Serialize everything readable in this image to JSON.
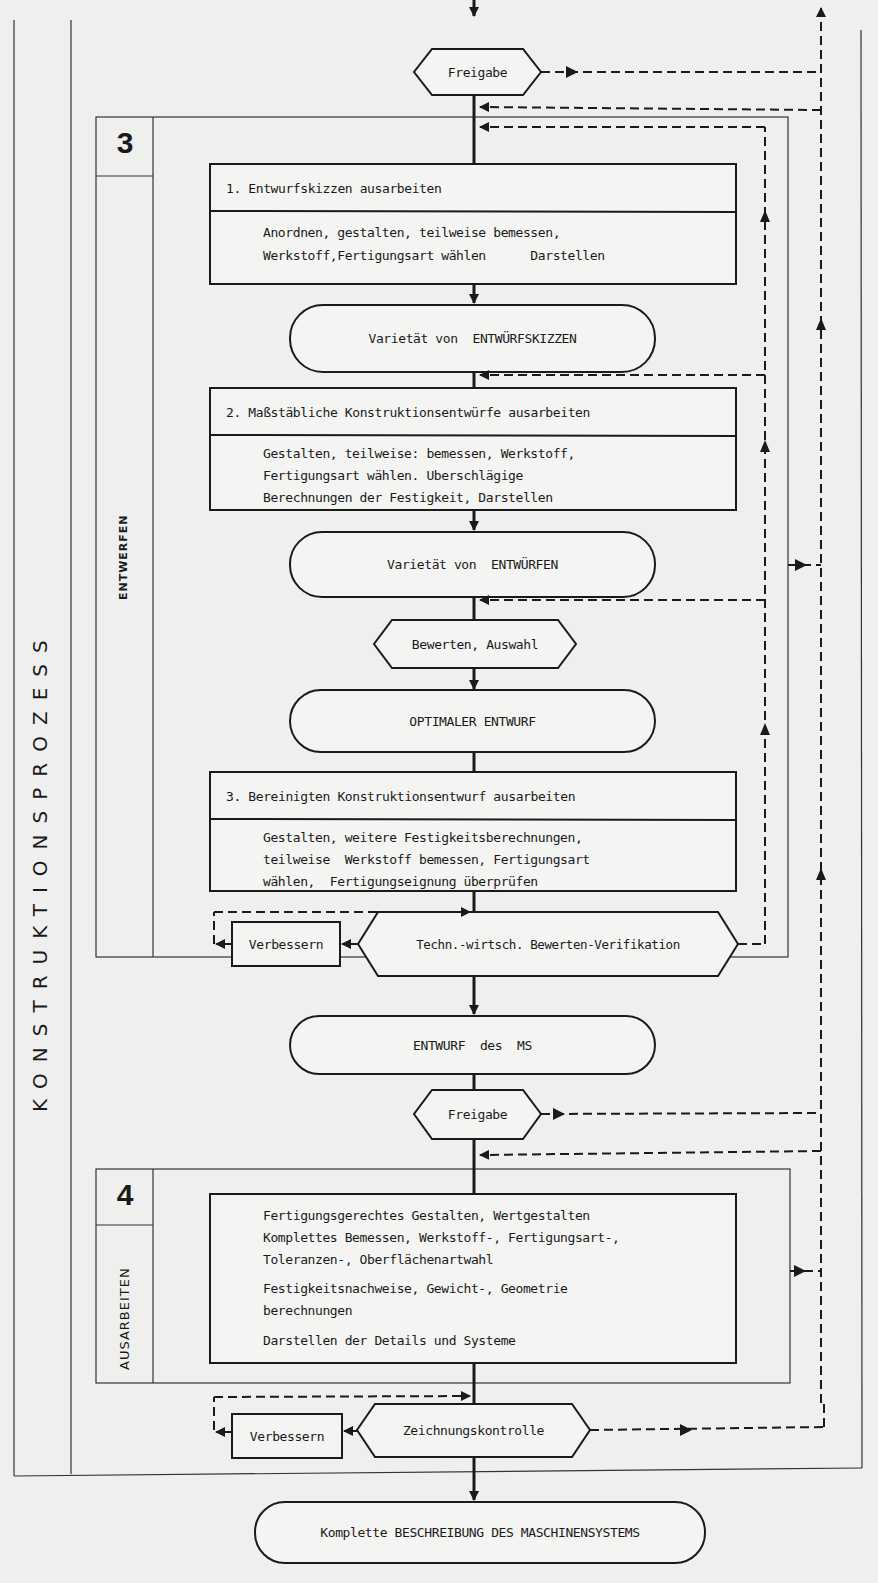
{
  "diagram": {
    "title": "KONSTRUKTIONSPROZESS",
    "phases": [
      {
        "number": "3",
        "name": "ENTWERFEN",
        "steps": [
          {
            "id": "1",
            "heading": "1.  Entwurfskizzen ausarbeiten",
            "lines": [
              "Anordnen, gestalten, teilweise bemessen,",
              "Werkstoff,Fertigungsart wählen      Darstellen"
            ]
          },
          {
            "type": "result",
            "label": "Varietät von  ENTWÜRFSKIZZEN"
          },
          {
            "id": "2",
            "heading": "2.  Maßstäbliche Konstruktionsentwürfe ausarbeiten",
            "lines": [
              "Gestalten, teilweise: bemessen, Werkstoff,",
              "Fertigungsart wählen. Uberschlägige",
              "Berechnungen der Festigkeit, Darstellen"
            ]
          },
          {
            "type": "result",
            "label": "Varietät von  ENTWÜRFEN"
          },
          {
            "type": "decision",
            "label": "Bewerten, Auswahl"
          },
          {
            "type": "result",
            "label": "OPTIMALER ENTWURF"
          },
          {
            "id": "3",
            "heading": "3.  Bereinigten Konstruktionsentwurf ausarbeiten",
            "lines": [
              "Gestalten, weitere Festigkeitsberechnungen,",
              "teilweise  Werkstoff bemessen, Fertigungsart",
              "wählen,  Fertigungseignung überprüfen"
            ]
          },
          {
            "type": "decision",
            "label": "Techn.-wirtsch. Bewerten-Verifikation"
          },
          {
            "type": "action",
            "label": "Verbessern"
          }
        ]
      },
      {
        "number": "4",
        "name": "AUSARBEITEN",
        "steps": [
          {
            "paragraphs": [
              [
                "Fertigungsgerechtes Gestalten, Wertgestalten",
                "Komplettes Bemessen, Werkstoff-, Fertigungsart-,",
                "Toleranzen-, Oberflächenartwahl"
              ],
              [
                "Festigkeitsnachweise, Gewicht-, Geometrie",
                "berechnungen"
              ],
              [
                "Darstellen der Details und Systeme"
              ]
            ]
          },
          {
            "type": "decision",
            "label": "Zeichnungskontrolle"
          },
          {
            "type": "action",
            "label": "Verbessern"
          }
        ]
      }
    ],
    "gates": {
      "top": "Freigabe",
      "middle": "Freigabe"
    },
    "intermediate_result": "ENTWURF  des  MS",
    "final_result": "Komplette BESCHREIBUNG DES MASCHINENSYSTEMS"
  }
}
